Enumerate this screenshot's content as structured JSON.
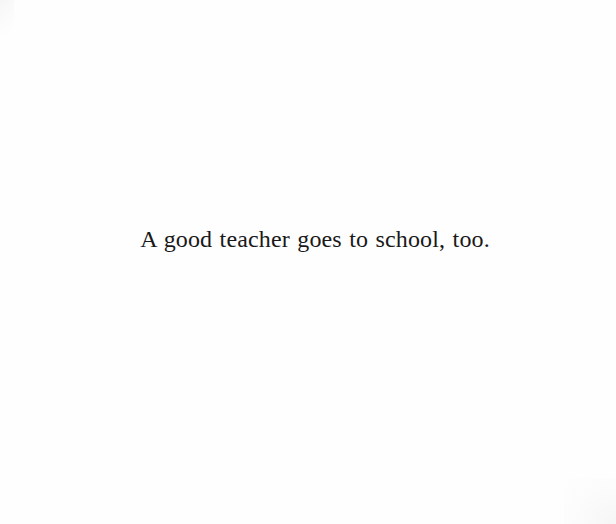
{
  "page": {
    "kind": "scanned-book-page",
    "background_color": "#fefefe",
    "width": 616,
    "height": 524
  },
  "quotation": {
    "text": "A good teacher goes to school, too.",
    "color": "#191919",
    "alignment": "center"
  }
}
